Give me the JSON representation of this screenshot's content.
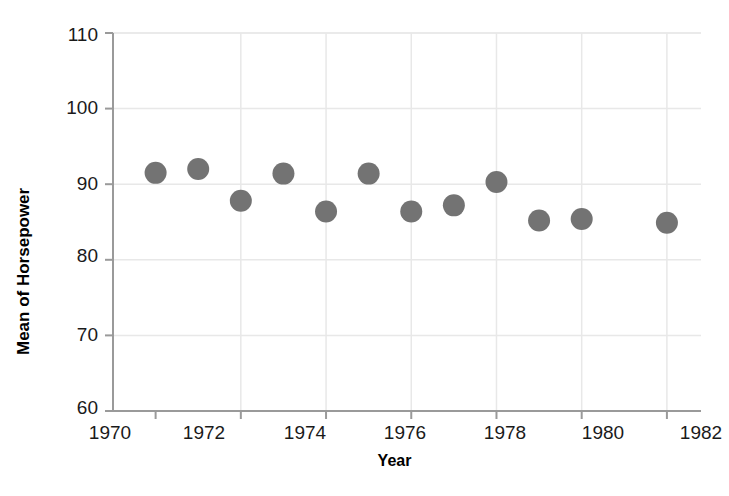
{
  "chart_data": {
    "type": "scatter",
    "title": "",
    "xlabel": "Year",
    "ylabel": "Mean of Horsepower",
    "xlim": [
      1969.0,
      1982.8
    ],
    "ylim": [
      60,
      110
    ],
    "xticks": [
      1970,
      1972,
      1974,
      1976,
      1978,
      1980,
      1982
    ],
    "yticks": [
      60,
      70,
      80,
      90,
      100,
      110
    ],
    "xtick_labels": [
      "1970",
      "1972",
      "1974",
      "1976",
      "1978",
      "1980",
      "1982"
    ],
    "ytick_labels": [
      "60",
      "70",
      "80",
      "90",
      "100",
      "110"
    ],
    "grid": true,
    "legend": "none",
    "marker_color": "#737373",
    "marker_shape": "circle",
    "marker_size": 22,
    "x": [
      1970,
      1971,
      1972,
      1973,
      1974,
      1975,
      1976,
      1977,
      1978,
      1979,
      1980,
      1982
    ],
    "y": [
      91.5,
      92.0,
      87.8,
      91.4,
      86.4,
      91.4,
      86.4,
      87.2,
      90.3,
      85.2,
      85.4,
      84.9
    ],
    "points": [
      {
        "x": 1970,
        "y": 91.5
      },
      {
        "x": 1971,
        "y": 92.0
      },
      {
        "x": 1972,
        "y": 87.8
      },
      {
        "x": 1973,
        "y": 91.4
      },
      {
        "x": 1974,
        "y": 86.4
      },
      {
        "x": 1975,
        "y": 91.4
      },
      {
        "x": 1976,
        "y": 86.4
      },
      {
        "x": 1977,
        "y": 87.2
      },
      {
        "x": 1978,
        "y": 90.3
      },
      {
        "x": 1979,
        "y": 85.2
      },
      {
        "x": 1980,
        "y": 85.4
      },
      {
        "x": 1982,
        "y": 84.9
      }
    ]
  },
  "axes": {
    "y_title": "Mean of Horsepower",
    "x_title": "Year",
    "y_labels": [
      "110",
      "100",
      "90",
      "80",
      "70",
      "60"
    ],
    "x_labels": [
      "1970",
      "1972",
      "1974",
      "1976",
      "1978",
      "1980",
      "1982"
    ]
  }
}
